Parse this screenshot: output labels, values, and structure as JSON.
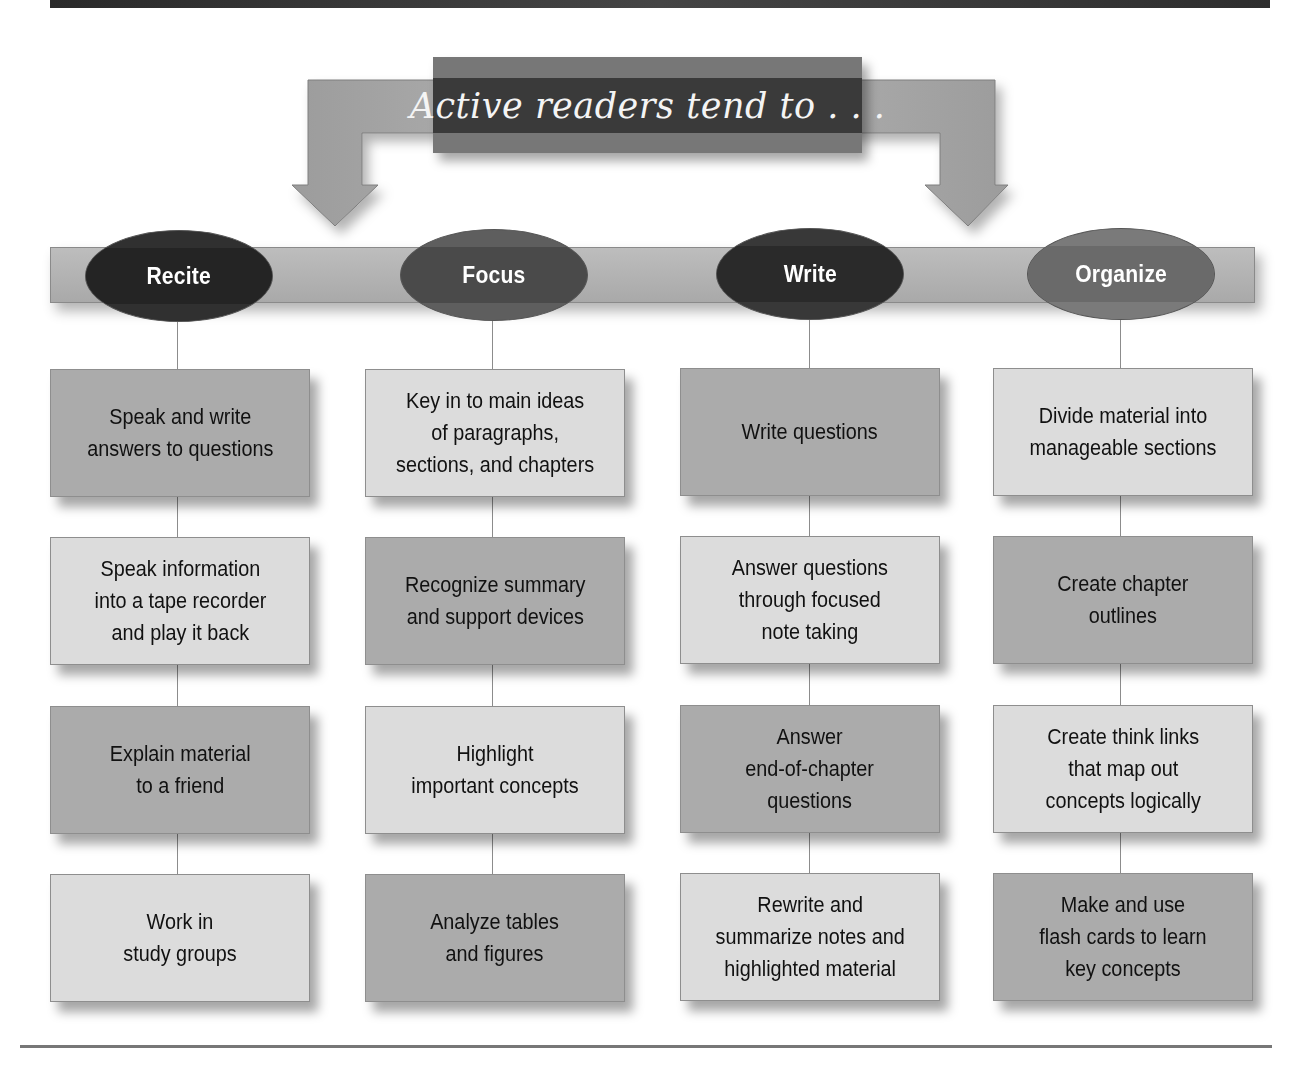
{
  "title": "Active readers tend to . . .",
  "colors": {
    "banner": "#333333",
    "title_outer": "#777777",
    "title_band": "#3a3a3a",
    "arrow": "#a0a0a0",
    "bar": "#b5b5b5",
    "box_dark": "#ababab",
    "box_light": "#dcdcdc"
  },
  "columns": [
    {
      "label": "Recite",
      "oval_color": "#303030",
      "band_color": "#242424",
      "items": [
        {
          "text": "Speak and write\nanswers to questions",
          "shade": "dark"
        },
        {
          "text": "Speak information\ninto a tape recorder\nand play it back",
          "shade": "light"
        },
        {
          "text": "Explain material\nto a friend",
          "shade": "dark"
        },
        {
          "text": "Work in\nstudy groups",
          "shade": "light"
        }
      ]
    },
    {
      "label": "Focus",
      "oval_color": "#5e5e5e",
      "band_color": "#4a4a4a",
      "items": [
        {
          "text": "Key in to main ideas\nof paragraphs,\nsections, and chapters",
          "shade": "light"
        },
        {
          "text": "Recognize summary\nand support devices",
          "shade": "dark"
        },
        {
          "text": "Highlight\nimportant concepts",
          "shade": "light"
        },
        {
          "text": "Analyze tables\nand figures",
          "shade": "dark"
        }
      ]
    },
    {
      "label": "Write",
      "oval_color": "#383838",
      "band_color": "#2a2a2a",
      "items": [
        {
          "text": "Write questions",
          "shade": "dark"
        },
        {
          "text": "Answer questions\nthrough focused\nnote taking",
          "shade": "light"
        },
        {
          "text": "Answer\nend-of-chapter\nquestions",
          "shade": "dark"
        },
        {
          "text": "Rewrite and\nsummarize notes and\nhighlighted material",
          "shade": "light"
        }
      ]
    },
    {
      "label": "Organize",
      "oval_color": "#7a7a7a",
      "band_color": "#6a6a6a",
      "items": [
        {
          "text": "Divide material into\nmanageable sections",
          "shade": "light"
        },
        {
          "text": "Create chapter\noutlines",
          "shade": "dark"
        },
        {
          "text": "Create think links\nthat map out\nconcepts logically",
          "shade": "light"
        },
        {
          "text": "Make and use\nflash cards to learn\nkey concepts",
          "shade": "dark"
        }
      ]
    }
  ]
}
